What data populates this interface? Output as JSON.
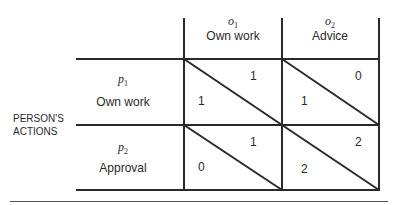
{
  "row_axis_label": "PERSON'S\nACTIONS",
  "row_axis_lines": [
    "PERSON'S",
    "ACTIONS"
  ],
  "columns": [
    {
      "symbol": "o",
      "subscript": "1",
      "label": "Own work"
    },
    {
      "symbol": "o",
      "subscript": "2",
      "label": "Advice"
    }
  ],
  "rows": [
    {
      "symbol": "p",
      "subscript": "1",
      "label": "Own work",
      "cells": [
        {
          "upper": "1",
          "lower": "1"
        },
        {
          "upper": "0",
          "lower": "1"
        }
      ]
    },
    {
      "symbol": "p",
      "subscript": "2",
      "label": "Approval",
      "cells": [
        {
          "upper": "1",
          "lower": "0"
        },
        {
          "upper": "2",
          "lower": "2"
        }
      ]
    }
  ],
  "line_color": "#2a2a2a"
}
